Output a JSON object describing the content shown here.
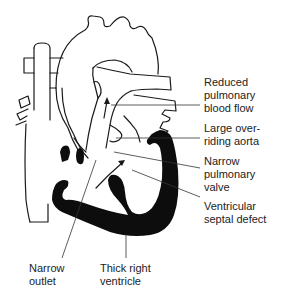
{
  "diagram": {
    "labels": {
      "reduced_pulmonary_blood_flow": [
        "Reduced",
        "pulmonary",
        "blood flow"
      ],
      "large_overriding_aorta": [
        "Large over-",
        "riding aorta"
      ],
      "narrow_pulmonary_valve": [
        "Narrow",
        "pulmonary",
        "valve"
      ],
      "ventricular_septal_defect": [
        "Ventricular",
        "septal defect"
      ],
      "narrow_outlet": [
        "Narrow",
        "outlet"
      ],
      "thick_right_ventricle": [
        "Thick right",
        "ventricle"
      ]
    },
    "colors": {
      "line": "#1a1a1a",
      "fill": "#0d0d0d",
      "background": "#ffffff"
    }
  }
}
